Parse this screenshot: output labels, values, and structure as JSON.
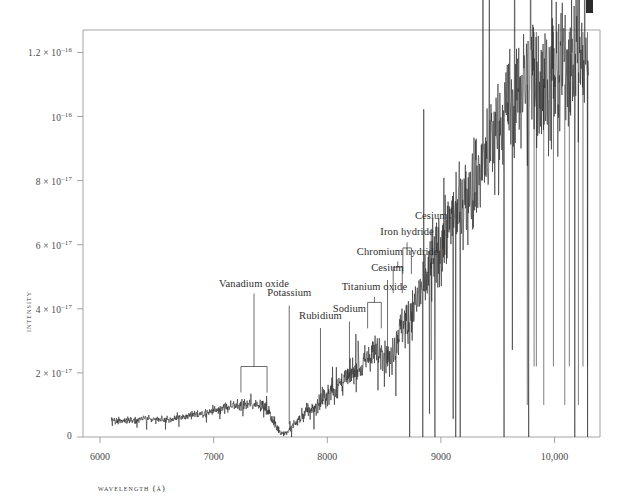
{
  "figure": {
    "background_color": "#ffffff",
    "spectrum_color": "#2d2d2d",
    "axis_color": "#9a9a9a",
    "annotation_color": "#2e2e2e",
    "edge_mark_color": "#2b2b2b"
  },
  "chart_data": {
    "type": "line",
    "title": "",
    "subtitle": "",
    "xlabel": "WAVELENGTH (Å)",
    "ylabel": "INTENSITY",
    "xlim": [
      5850,
      10400
    ],
    "ylim": [
      0,
      1.27e-16
    ],
    "grid": false,
    "legend_position": "none",
    "xticks": [
      6000,
      7000,
      8000,
      9000,
      10000
    ],
    "xticklabels": [
      "6000",
      "7000",
      "8000",
      "9000",
      "10,000"
    ],
    "yticks": [
      0,
      2e-17,
      4e-17,
      6e-17,
      8e-17,
      1e-16,
      1.2e-16
    ],
    "yticklabels": [
      "0",
      "2 × 10",
      "4 × 10",
      "6 × 10",
      "8 × 10",
      "10",
      "1.2 × 10"
    ],
    "ytick_exponents": [
      "",
      "–17",
      "–17",
      "–17",
      "–17",
      "–16",
      "–16"
    ],
    "series": [
      {
        "name": "Brown dwarf spectrum",
        "x_start": 6100,
        "x_end": 10300,
        "description": "Noisy optical/near-infrared spectrum rising steeply toward the red",
        "anchor_x": [
          6100,
          6200,
          6300,
          6400,
          6500,
          6600,
          6700,
          6800,
          6900,
          7000,
          7100,
          7200,
          7300,
          7400,
          7450,
          7500,
          7550,
          7600,
          7650,
          7700,
          7750,
          7800,
          7900,
          8000,
          8100,
          8200,
          8300,
          8400,
          8500,
          8550,
          8600,
          8700,
          8800,
          8900,
          9000,
          9100,
          9200,
          9300,
          9400,
          9500,
          9600,
          9700,
          9800,
          9900,
          10000,
          10100,
          10200,
          10300
        ],
        "anchor_y": [
          5.0,
          5.2,
          5.4,
          5.6,
          5.6,
          5.5,
          6.0,
          6.6,
          7.4,
          8.2,
          9.2,
          9.8,
          10.2,
          10.3,
          9.6,
          7.0,
          3.2,
          1.2,
          1.6,
          3.6,
          5.6,
          7.2,
          9.6,
          13.0,
          16.0,
          19.0,
          22.0,
          26.0,
          28.0,
          22.0,
          31.0,
          36.0,
          44.0,
          52.0,
          60.0,
          68.0,
          74.0,
          80.0,
          88.0,
          96.0,
          102.0,
          108.0,
          114.0,
          110.0,
          112.0,
          115.0,
          118.0,
          116.0
        ],
        "anchor_y_units": "1e-18",
        "noise_amplitude_units": "1e-18",
        "noise_profile": [
          0.8,
          0.8,
          0.9,
          0.9,
          0.9,
          0.9,
          1.0,
          1.0,
          1.1,
          1.1,
          1.2,
          1.3,
          1.4,
          1.5,
          1.6,
          1.6,
          1.2,
          0.8,
          0.9,
          1.3,
          1.6,
          1.9,
          2.2,
          2.6,
          3.0,
          3.4,
          3.8,
          4.4,
          5.0,
          5.2,
          5.6,
          6.5,
          7.5,
          8.6,
          9.8,
          11.0,
          12.0,
          13.0,
          14.0,
          15.0,
          16.0,
          17.0,
          18.0,
          18.0,
          18.0,
          18.0,
          18.0,
          18.0
        ]
      }
    ],
    "annotations": [
      {
        "id": "vanadium-oxide",
        "label": "Vanadium oxide",
        "marker": "bracket",
        "x_left": 7240,
        "x_right": 7470,
        "x_center": 7355,
        "y_bracket": 2.2e-17,
        "label_x": 7355,
        "label_y": 4.6e-17
      },
      {
        "id": "potassium",
        "label": "Potassium",
        "marker": "line",
        "x_center": 7665,
        "y_top": 4.1e-17,
        "y_bottom": 4e-18,
        "label_x": 7665,
        "label_y": 4.3e-17
      },
      {
        "id": "rubidium",
        "label": "Rubidium",
        "marker": "line",
        "x_center": 7940,
        "y_top": 3.4e-17,
        "y_bottom": 1e-17,
        "label_x": 7940,
        "label_y": 3.6e-17
      },
      {
        "id": "sodium",
        "label": "Sodium",
        "marker": "line",
        "x_center": 8195,
        "y_top": 3.6e-17,
        "y_bottom": 1.7e-17,
        "label_x": 8195,
        "label_y": 3.8e-17
      },
      {
        "id": "titanium-oxide",
        "label": "Titanium oxide",
        "marker": "bracket",
        "x_left": 8355,
        "x_right": 8475,
        "x_center": 8415,
        "y_bracket": 4.2e-17,
        "label_x": 8415,
        "label_y": 4.5e-17
      },
      {
        "id": "cesium-left",
        "label": "Cesium",
        "marker": "line",
        "x_center": 8530,
        "y_top": 4.9e-17,
        "y_bottom": 2.4e-17,
        "label_x": 8530,
        "label_y": 5.1e-17
      },
      {
        "id": "chromium-hydride",
        "label": "Chromium hydride",
        "marker": "bracket",
        "x_left": 8580,
        "x_right": 8660,
        "x_center": 8620,
        "y_bracket": 5.3e-17,
        "label_x": 8620,
        "label_y": 5.6e-17
      },
      {
        "id": "iron-hydride",
        "label": "Iron hydride",
        "marker": "bracket",
        "x_left": 8665,
        "x_right": 8740,
        "x_center": 8702,
        "y_bracket": 5.9e-17,
        "label_x": 8702,
        "label_y": 6.2e-17
      },
      {
        "id": "cesium-right",
        "label": "Cesium",
        "marker": "line",
        "x_center": 8915,
        "y_top": 6.5e-17,
        "y_bottom": 2.4e-17,
        "label_x": 8915,
        "label_y": 6.7e-17
      }
    ]
  },
  "axes": {
    "y_title": "INTENSITY",
    "x_title": "WAVELENGTH (Å)",
    "y_tick_items": [
      {
        "mantissa": "1.2 × 10",
        "exponent": "–16"
      },
      {
        "mantissa": "10",
        "exponent": "–16"
      },
      {
        "mantissa": "8 × 10",
        "exponent": "–17"
      },
      {
        "mantissa": "6 × 10",
        "exponent": "–17"
      },
      {
        "mantissa": "4 × 10",
        "exponent": "–17"
      },
      {
        "mantissa": "2 × 10",
        "exponent": "–17"
      },
      {
        "mantissa": "0",
        "exponent": ""
      }
    ],
    "x_tick_items": [
      "6000",
      "7000",
      "8000",
      "9000",
      "10,000"
    ]
  }
}
